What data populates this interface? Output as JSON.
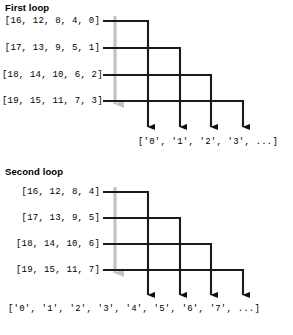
{
  "figure": {
    "background_color": "#ffffff",
    "line_color": "#1a1a1a",
    "guide_arrow_color": "#bfbfbf"
  },
  "sections": [
    {
      "id": "first-loop",
      "title": "First loop",
      "rows": [
        "[16, 12, 8, 4, 0]",
        "[17, 13, 9, 5, 1]",
        "[18, 14, 10, 6, 2]",
        "[19, 15, 11, 7, 3]"
      ],
      "output": "['0', '1', '2', '3', ...]",
      "output_items": [
        "'0'",
        "'1'",
        "'2'",
        "'3'",
        "..."
      ],
      "arrow_count": 4
    },
    {
      "id": "second-loop",
      "title": "Second loop",
      "rows": [
        "[16, 12, 8, 4]",
        "[17, 13, 9, 5]",
        "[18, 14, 10, 6]",
        "[19, 15, 11, 7]"
      ],
      "output": "['0', '1', '2', '3', '4', '5', '6', '7', ...]",
      "output_items": [
        "'0'",
        "'1'",
        "'2'",
        "'3'",
        "'4'",
        "'5'",
        "'6'",
        "'7'",
        "..."
      ],
      "arrow_count": 4
    }
  ]
}
